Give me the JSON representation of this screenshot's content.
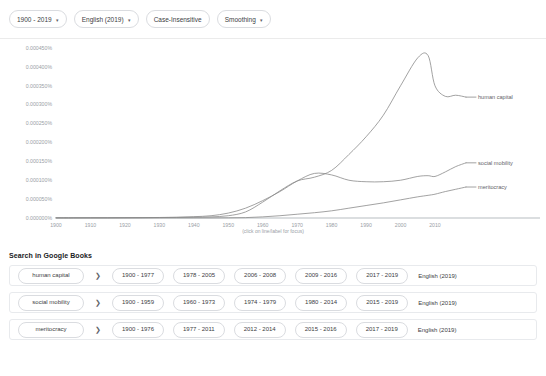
{
  "toolbar": {
    "date_range": "1900 - 2019",
    "corpus": "English (2019)",
    "case_sensitivity": "Case-Insensitive",
    "smoothing": "Smoothing",
    "caret": "▾"
  },
  "chart_hint": "(click on line/label for focus)",
  "search_section": {
    "heading": "Search in Google Books",
    "arrow": "❯",
    "rows": [
      {
        "term": "human capital",
        "ranges": [
          "1900 - 1977",
          "1978 - 2005",
          "2006 - 2008",
          "2009 - 2016",
          "2017 - 2019"
        ],
        "language": "English (2019)"
      },
      {
        "term": "social mobility",
        "ranges": [
          "1900 - 1959",
          "1960 - 1973",
          "1974 - 1979",
          "1980 - 2014",
          "2015 - 2019"
        ],
        "language": "English (2019)"
      },
      {
        "term": "meritocracy",
        "ranges": [
          "1900 - 1976",
          "1977 - 2011",
          "2012 - 2014",
          "2015 - 2016",
          "2017 - 2019"
        ],
        "language": "English (2019)"
      }
    ]
  },
  "chart_data": {
    "type": "line",
    "title": "",
    "xlabel": "",
    "ylabel": "",
    "xlim": [
      1900,
      2019
    ],
    "ylim": [
      0,
      0.00045
    ],
    "grid": false,
    "legend_position": "right-inline",
    "xticks": [
      1900,
      1910,
      1920,
      1930,
      1940,
      1950,
      1960,
      1970,
      1980,
      1990,
      2000,
      2010
    ],
    "yticks": [
      0.0,
      5e-05,
      0.0001,
      0.00015,
      0.0002,
      0.00025,
      0.0003,
      0.00035,
      0.0004,
      0.00045
    ],
    "ytick_labels": [
      "0.000000%",
      "0.000050%",
      "0.000100%",
      "0.000150%",
      "0.000200%",
      "0.000250%",
      "0.000300%",
      "0.000350%",
      "0.000400%",
      "0.000450%"
    ],
    "xtick_labels": [
      "1900",
      "1910",
      "1920",
      "1930",
      "1940",
      "1950",
      "1960",
      "1970",
      "1980",
      "1990",
      "2000",
      "2010"
    ],
    "x": [
      1900,
      1905,
      1910,
      1915,
      1920,
      1925,
      1930,
      1935,
      1940,
      1945,
      1950,
      1955,
      1960,
      1965,
      1970,
      1975,
      1980,
      1985,
      1990,
      1995,
      2000,
      2005,
      2008,
      2010,
      2013,
      2016,
      2019
    ],
    "series": [
      {
        "name": "human capital",
        "color": "#8a8a8a",
        "values": [
          5e-07,
          5e-07,
          6e-07,
          6e-07,
          8e-07,
          1e-06,
          1.2e-06,
          1.5e-06,
          2e-06,
          3e-06,
          6e-06,
          1.6e-05,
          4.2e-05,
          7.2e-05,
          9.8e-05,
          0.000108,
          0.000126,
          0.000168,
          0.000215,
          0.000272,
          0.00035,
          0.000424,
          0.00043,
          0.00035,
          0.000322,
          0.000325,
          0.00032
        ]
      },
      {
        "name": "social mobility",
        "color": "#8a8a8a",
        "values": [
          4e-07,
          4e-07,
          5e-07,
          6e-07,
          8e-07,
          1e-06,
          1.4e-06,
          2e-06,
          3.5e-06,
          6e-06,
          1.3e-05,
          2.6e-05,
          4.6e-05,
          7e-05,
          9.8e-05,
          0.000118,
          0.000114,
          0.0001,
          9.6e-05,
          9.6e-05,
          0.0001,
          0.00011,
          0.000112,
          0.00011,
          0.000122,
          0.000136,
          0.000146
        ]
      },
      {
        "name": "meritocracy",
        "color": "#8a8a8a",
        "values": [
          1e-07,
          1e-07,
          1e-07,
          1e-07,
          1e-07,
          1e-07,
          2e-07,
          2e-07,
          2e-07,
          3e-07,
          5e-07,
          1e-06,
          3e-06,
          6e-06,
          1e-05,
          1.4e-05,
          1.9e-05,
          2.6e-05,
          3.3e-05,
          4e-05,
          4.8e-05,
          5.6e-05,
          6e-05,
          6.3e-05,
          7e-05,
          7.6e-05,
          8.2e-05
        ]
      }
    ]
  }
}
